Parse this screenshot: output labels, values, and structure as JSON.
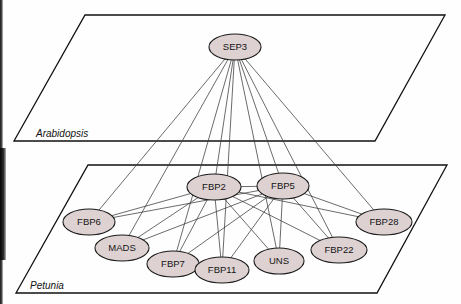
{
  "figure": {
    "type": "network-diagram",
    "planes": [
      {
        "id": "arabidopsis",
        "label": "Arabidopsis",
        "label_x": 36,
        "label_y": 137,
        "points": "85,15 445,15 375,141 14,141"
      },
      {
        "id": "petunia",
        "label": "Petunia",
        "label_x": 30,
        "label_y": 289,
        "points": "88,165 447,165 377,293 16,293"
      }
    ],
    "nodes": [
      {
        "id": "SEP3",
        "label": "SEP3",
        "plane": "arabidopsis",
        "cx": 235,
        "cy": 47,
        "rx": 26,
        "ry": 13
      },
      {
        "id": "FBP2",
        "label": "FBP2",
        "plane": "petunia",
        "cx": 214,
        "cy": 187,
        "rx": 27,
        "ry": 13
      },
      {
        "id": "FBP5",
        "label": "FBP5",
        "plane": "petunia",
        "cx": 283,
        "cy": 186,
        "rx": 26,
        "ry": 13
      },
      {
        "id": "FBP6",
        "label": "FBP6",
        "plane": "petunia",
        "cx": 89,
        "cy": 222,
        "rx": 26,
        "ry": 13
      },
      {
        "id": "FBP28",
        "label": "FBP28",
        "plane": "petunia",
        "cx": 384,
        "cy": 222,
        "rx": 28,
        "ry": 13
      },
      {
        "id": "MADS",
        "label": "MADS",
        "plane": "petunia",
        "cx": 122,
        "cy": 248,
        "rx": 27,
        "ry": 13
      },
      {
        "id": "FBP22",
        "label": "FBP22",
        "plane": "petunia",
        "cx": 339,
        "cy": 250,
        "rx": 28,
        "ry": 13
      },
      {
        "id": "FBP7",
        "label": "FBP7",
        "plane": "petunia",
        "cx": 173,
        "cy": 264,
        "rx": 26,
        "ry": 13
      },
      {
        "id": "UNS",
        "label": "UNS",
        "plane": "petunia",
        "cx": 279,
        "cy": 261,
        "rx": 25,
        "ry": 13
      },
      {
        "id": "FBP11",
        "label": "FBP11",
        "plane": "petunia",
        "cx": 222,
        "cy": 270,
        "rx": 27,
        "ry": 13
      }
    ],
    "edges": [
      {
        "source": "SEP3",
        "target": "FBP6"
      },
      {
        "source": "SEP3",
        "target": "MADS"
      },
      {
        "source": "SEP3",
        "target": "FBP7"
      },
      {
        "source": "SEP3",
        "target": "FBP2"
      },
      {
        "source": "SEP3",
        "target": "FBP11"
      },
      {
        "source": "SEP3",
        "target": "FBP5"
      },
      {
        "source": "SEP3",
        "target": "UNS"
      },
      {
        "source": "SEP3",
        "target": "FBP22"
      },
      {
        "source": "SEP3",
        "target": "FBP28"
      },
      {
        "source": "FBP2",
        "target": "FBP6"
      },
      {
        "source": "FBP2",
        "target": "MADS"
      },
      {
        "source": "FBP2",
        "target": "FBP7"
      },
      {
        "source": "FBP2",
        "target": "FBP11"
      },
      {
        "source": "FBP2",
        "target": "UNS"
      },
      {
        "source": "FBP2",
        "target": "FBP22"
      },
      {
        "source": "FBP2",
        "target": "FBP28"
      },
      {
        "source": "FBP2",
        "target": "FBP5"
      },
      {
        "source": "FBP5",
        "target": "FBP6"
      },
      {
        "source": "FBP5",
        "target": "MADS"
      },
      {
        "source": "FBP5",
        "target": "FBP7"
      },
      {
        "source": "FBP5",
        "target": "FBP11"
      },
      {
        "source": "FBP5",
        "target": "UNS"
      },
      {
        "source": "FBP5",
        "target": "FBP22"
      },
      {
        "source": "FBP5",
        "target": "FBP28"
      }
    ],
    "colors": {
      "node_fill": "#ded1d2",
      "node_stroke": "#1a1a1a",
      "edge": "#3a3a3a",
      "plane_stroke": "#111111",
      "background": "#fefefe"
    }
  }
}
